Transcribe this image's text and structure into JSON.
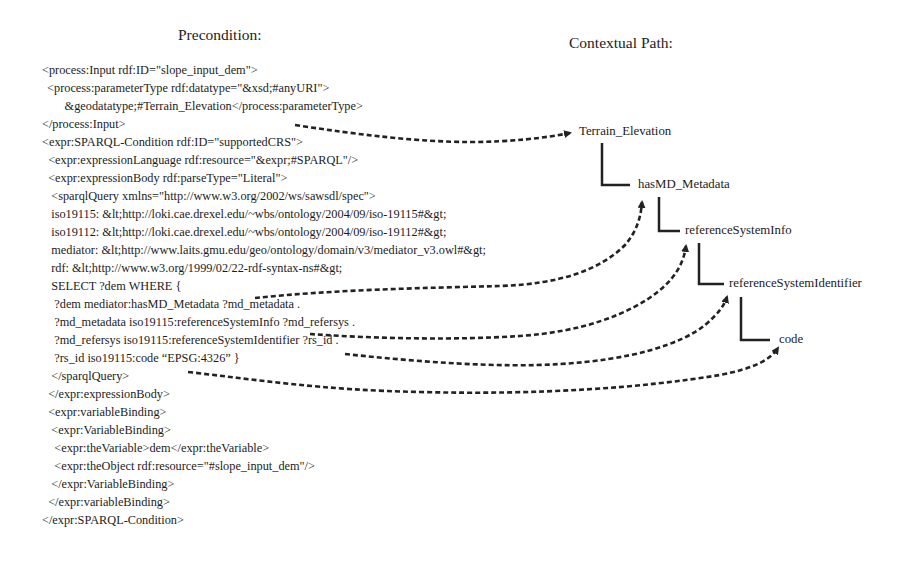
{
  "precondition": {
    "title": "Precondition:",
    "lines": [
      "<process:Input rdf:ID=\"slope_input_dem\">",
      " <process:parameterType rdf:datatype=\"&xsd;#anyURI\">",
      "        &geodatatype;#Terrain_Elevation</process:parameterType>",
      "</process:Input>",
      "<expr:SPARQL-Condition rdf:ID=\"supportedCRS\">",
      "  <expr:expressionLanguage rdf:resource=\"&expr;#SPARQL\"/>",
      "  <expr:expressionBody rdf:parseType=\"Literal\">",
      "   <sparqlQuery xmlns=\"http://www.w3.org/2002/ws/sawsdl/spec\">",
      "   iso19115: &lt;http://loki.cae.drexel.edu/~wbs/ontology/2004/09/iso-19115#&gt;",
      "   iso19112: &lt;http://loki.cae.drexel.edu/~wbs/ontology/2004/09/iso-19112#&gt;",
      "   mediator: &lt;http://www.laits.gmu.edu/geo/ontology/domain/v3/mediator_v3.owl#&gt;",
      "   rdf: &lt;http://www.w3.org/1999/02/22-rdf-syntax-ns#&gt;",
      "   SELECT ?dem WHERE {",
      "    ?dem mediator:hasMD_Metadata ?md_metadata .",
      "    ?md_metadata iso19115:referenceSystemInfo ?md_refersys .",
      "    ?md_refersys iso19115:referenceSystemIdentifier ?rs_id .",
      "    ?rs_id iso19115:code “EPSG:4326” }",
      "   </sparqlQuery>",
      "  </expr:expressionBody>",
      "  <expr:variableBinding>",
      "   <expr:VariableBinding>",
      "    <expr:theVariable>dem</expr:theVariable>",
      "    <expr:theObject rdf:resource=\"#slope_input_dem\"/>",
      "   </expr:VariableBinding>",
      "  </expr:variableBinding>",
      "</expr:SPARQL-Condition>"
    ]
  },
  "contextual_path": {
    "title": "Contextual Path:",
    "nodes": [
      "Terrain_Elevation",
      "hasMD_Metadata",
      "referenceSystemInfo",
      "referenceSystemIdentifier",
      "code"
    ]
  }
}
